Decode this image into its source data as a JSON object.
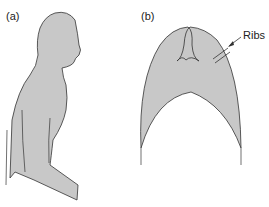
{
  "figure": {
    "panel_a_label": "(a)",
    "panel_b_label": "(b)",
    "annotation_ribs": "Ribs",
    "fill_color": "#c8c8c8",
    "stroke_color": "#333333"
  }
}
